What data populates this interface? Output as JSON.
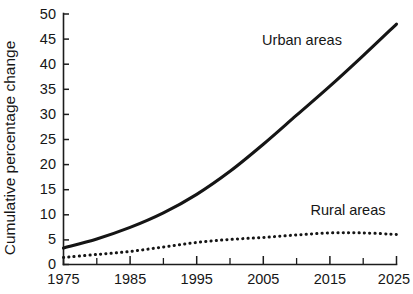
{
  "chart_data": {
    "type": "line",
    "title": "",
    "xlabel": "",
    "ylabel": "Cumulative percentage change",
    "xlim": [
      1975,
      2025
    ],
    "ylim": [
      0,
      50
    ],
    "grid": false,
    "legend_position": "inline-annotations",
    "xticks": [
      1975,
      1985,
      1995,
      2005,
      2015,
      2025
    ],
    "xtick_labels": [
      "1975",
      "1985",
      "1995",
      "2005",
      "2015",
      "2025"
    ],
    "xminor_ticks": [
      1980,
      1990,
      2000,
      2010,
      2020
    ],
    "yticks": [
      0,
      5,
      10,
      15,
      20,
      25,
      30,
      35,
      40,
      45,
      50
    ],
    "ytick_labels": [
      "0",
      "5",
      "10",
      "15",
      "20",
      "25",
      "30",
      "35",
      "40",
      "45",
      "50"
    ],
    "x": [
      1975,
      1980,
      1985,
      1990,
      1995,
      2000,
      2005,
      2010,
      2015,
      2020,
      2025
    ],
    "series": [
      {
        "name": "Urban areas",
        "style": "solid",
        "label": "Urban areas",
        "values": [
          3.3,
          5.1,
          7.4,
          10.3,
          14.0,
          18.6,
          24.0,
          29.8,
          35.6,
          41.7,
          48.0
        ]
      },
      {
        "name": "Rural areas",
        "style": "dotted",
        "label": "Rural areas",
        "values": [
          1.4,
          2.0,
          2.6,
          3.5,
          4.4,
          5.0,
          5.4,
          5.9,
          6.3,
          6.3,
          6.0
        ]
      }
    ],
    "annotations": [
      {
        "text": "Urban areas",
        "x": 2005,
        "y": 45.5
      },
      {
        "text": "Rural areas",
        "x": 2014,
        "y": 11.5
      }
    ]
  },
  "axis": {
    "y_title": "Cumulative percentage change"
  },
  "labels": {
    "urban": "Urban areas",
    "rural": "Rural areas",
    "y0": "0",
    "y5": "5",
    "y10": "10",
    "y15": "15",
    "y20": "20",
    "y25": "25",
    "y30": "30",
    "y35": "35",
    "y40": "40",
    "y45": "45",
    "y50": "50",
    "x1975": "1975",
    "x1985": "1985",
    "x1995": "1995",
    "x2005": "2005",
    "x2015": "2015",
    "x2025": "2025"
  }
}
